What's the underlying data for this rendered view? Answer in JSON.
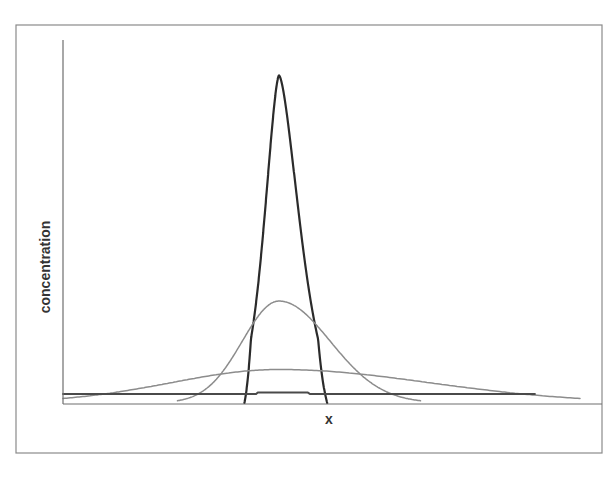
{
  "chart_data": {
    "type": "line",
    "title": "",
    "xlabel": "x",
    "ylabel": "concentration",
    "grid": false,
    "legend": "none",
    "ticks": "none",
    "xlim": [
      -1,
      1
    ],
    "ylim": [
      0,
      1
    ],
    "series": [
      {
        "name": "narrow peak",
        "color": "#2b2b2b",
        "width": 2.2,
        "shape": "peak",
        "center": 0.0,
        "sigma": 0.062,
        "amplitude": 0.9,
        "support": [
          -0.16,
          0.16
        ],
        "baseline": 0.0
      },
      {
        "name": "medium spread",
        "color": "#8c8c8c",
        "width": 1.5,
        "shape": "gaussian",
        "center": 0.0,
        "sigma": 0.17,
        "amplitude": 0.28,
        "support": [
          -0.47,
          0.47
        ],
        "baseline": 0.0
      },
      {
        "name": "wide spread",
        "color": "#8c8c8c",
        "width": 1.5,
        "shape": "gaussian",
        "center": 0.0,
        "sigma": 0.5,
        "amplitude": 0.092,
        "support": [
          -1.0,
          1.0
        ],
        "baseline": 0.0
      },
      {
        "name": "uniform (fully mixed)",
        "color": "#4a4a4a",
        "width": 2.0,
        "shape": "flat",
        "level": 0.025,
        "support": [
          -1.0,
          0.85
        ],
        "baseline": 0.0
      }
    ]
  },
  "layout": {
    "frame": {
      "x": 16,
      "y": 25,
      "w": 586,
      "h": 428
    },
    "plot": {
      "x0": 63,
      "x1": 602,
      "y_top": 40,
      "y_axis": 404,
      "data_x0": 63,
      "data_x1": 580
    },
    "xlabel_pos": {
      "x": 329,
      "y": 424
    },
    "ylabel_pos": {
      "x": 50,
      "y": 267
    }
  }
}
